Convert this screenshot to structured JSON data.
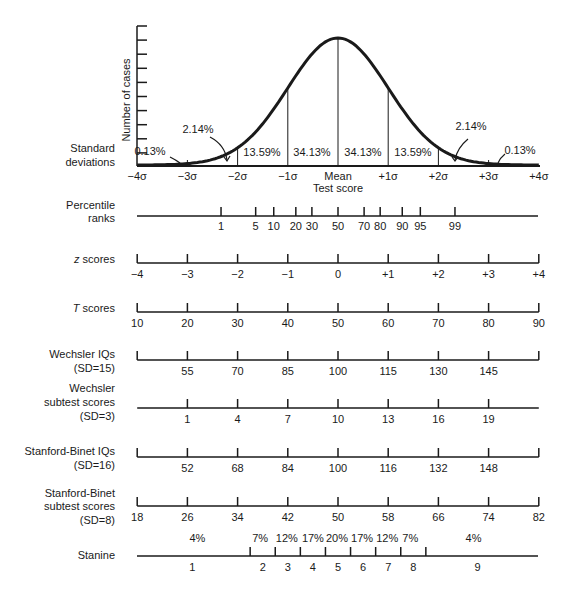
{
  "chart_data": {
    "type": "area",
    "title": "",
    "xlabel": "Test score",
    "ylabel": "Number of cases",
    "grid": false,
    "curve": "normal distribution",
    "sd_labels": [
      "−4σ",
      "−3σ",
      "−2σ",
      "−1σ",
      "Mean",
      "+1σ",
      "+2σ",
      "+3σ",
      "+4σ"
    ],
    "sd_values": [
      -4,
      -3,
      -2,
      -1,
      0,
      1,
      2,
      3,
      4
    ],
    "area_percents": [
      {
        "from": -4,
        "to": -3,
        "label": "0.13%"
      },
      {
        "from": -3,
        "to": -2,
        "label": "2.14%"
      },
      {
        "from": -2,
        "to": -1,
        "label": "13.59%"
      },
      {
        "from": -1,
        "to": 0,
        "label": "34.13%"
      },
      {
        "from": 0,
        "to": 1,
        "label": "34.13%"
      },
      {
        "from": 1,
        "to": 2,
        "label": "13.59%"
      },
      {
        "from": 2,
        "to": 3,
        "label": "2.14%"
      },
      {
        "from": 3,
        "to": 4,
        "label": "0.13%"
      }
    ],
    "y_ticks": 10,
    "scales": [
      {
        "name": "Percentile ranks",
        "ticks": [
          {
            "z": -2.33,
            "label": "1"
          },
          {
            "z": -1.64,
            "label": "5"
          },
          {
            "z": -1.28,
            "label": "10"
          },
          {
            "z": -0.84,
            "label": "20"
          },
          {
            "z": -0.52,
            "label": "30"
          },
          {
            "z": 0,
            "label": "50"
          },
          {
            "z": 0.52,
            "label": "70"
          },
          {
            "z": 0.84,
            "label": "80"
          },
          {
            "z": 1.28,
            "label": "90"
          },
          {
            "z": 1.64,
            "label": "95"
          },
          {
            "z": 2.33,
            "label": "99"
          }
        ]
      },
      {
        "name": "z scores",
        "ticks": [
          "−4",
          "−3",
          "−2",
          "−1",
          "0",
          "+1",
          "+2",
          "+3",
          "+4"
        ]
      },
      {
        "name": "T scores",
        "ticks": [
          "10",
          "20",
          "30",
          "40",
          "50",
          "60",
          "70",
          "80",
          "90"
        ]
      },
      {
        "name": "Wechsler IQs (SD=15)",
        "ticks": [
          "55",
          "70",
          "85",
          "100",
          "115",
          "130",
          "145"
        ]
      },
      {
        "name": "Wechsler subtest scores (SD=3)",
        "ticks": [
          "1",
          "4",
          "7",
          "10",
          "13",
          "16",
          "19"
        ]
      },
      {
        "name": "Stanford-Binet IQs (SD=16)",
        "ticks": [
          "52",
          "68",
          "84",
          "100",
          "116",
          "132",
          "148"
        ]
      },
      {
        "name": "Stanford-Binet subtest scores (SD=8)",
        "ticks": [
          "18",
          "26",
          "34",
          "42",
          "50",
          "58",
          "66",
          "74",
          "82"
        ]
      },
      {
        "name": "Stanine",
        "bands": [
          "1",
          "2",
          "3",
          "4",
          "5",
          "6",
          "7",
          "8",
          "9"
        ],
        "percents": [
          "4%",
          "7%",
          "12%",
          "17%",
          "20%",
          "17%",
          "12%",
          "7%",
          "4%"
        ]
      }
    ]
  },
  "labels": {
    "y_axis": "Number of cases",
    "std_dev_1": "Standard",
    "std_dev_2": "deviations",
    "x_axis": "Test score",
    "percentile_1": "Percentile",
    "percentile_2": "ranks",
    "z_scores_italic": "z",
    "z_scores_rest": " scores",
    "t_scores_italic": "T",
    "t_scores_rest": " scores",
    "wechsler_iq_1": "Wechsler IQs",
    "wechsler_iq_2": "(SD=15)",
    "wechsler_sub_1": "Wechsler",
    "wechsler_sub_2": "subtest scores",
    "wechsler_sub_3": "(SD=3)",
    "sb_iq_1": "Stanford-Binet IQs",
    "sb_iq_2": "(SD=16)",
    "sb_sub_1": "Stanford-Binet",
    "sb_sub_2": "subtest scores",
    "sb_sub_3": "(SD=8)",
    "stanine": "Stanine"
  }
}
